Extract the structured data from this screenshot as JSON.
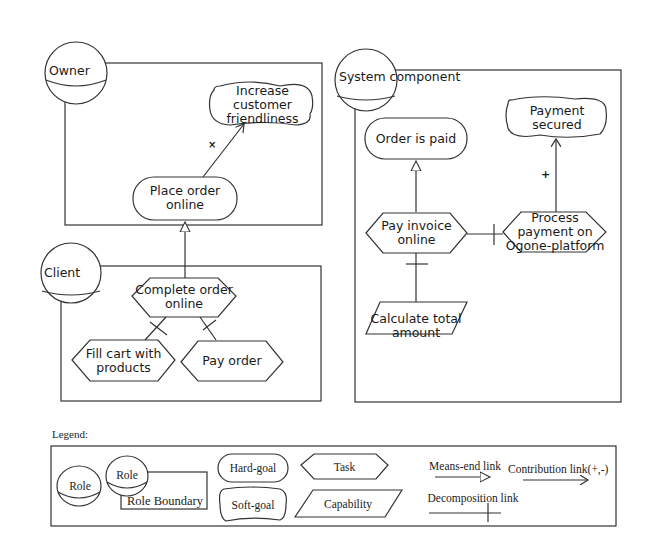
{
  "diagram": {
    "roles": [
      {
        "id": "owner",
        "label": "Owner"
      },
      {
        "id": "client",
        "label": "Client"
      },
      {
        "id": "system",
        "label": "System component"
      }
    ],
    "nodes": {
      "increase_customer_friendliness": {
        "type": "soft-goal",
        "lines": [
          "Increase",
          "customer",
          "friendliness"
        ]
      },
      "place_order_online": {
        "type": "hard-goal",
        "lines": [
          "Place order",
          "online"
        ]
      },
      "complete_order_online": {
        "type": "task",
        "lines": [
          "Complete order",
          "online"
        ]
      },
      "fill_cart": {
        "type": "task",
        "lines": [
          "Fill cart with",
          "products"
        ]
      },
      "pay_order": {
        "type": "task",
        "lines": [
          "Pay order"
        ]
      },
      "order_is_paid": {
        "type": "hard-goal",
        "lines": [
          "Order is paid"
        ]
      },
      "payment_secured": {
        "type": "soft-goal",
        "lines": [
          "Payment",
          "secured"
        ]
      },
      "pay_invoice_online": {
        "type": "task",
        "lines": [
          "Pay invoice",
          "online"
        ]
      },
      "process_payment": {
        "type": "task",
        "lines": [
          "Process",
          "payment on",
          "Ogone-platform"
        ]
      },
      "calculate_total": {
        "type": "capability",
        "lines": [
          "Calculate total",
          "amount"
        ]
      }
    },
    "links": [
      {
        "from": "place_order_online",
        "to": "increase_customer_friendliness",
        "type": "contribution",
        "sign": "×"
      },
      {
        "from": "complete_order_online",
        "to": "place_order_online",
        "type": "means-end"
      },
      {
        "from": "complete_order_online",
        "to": "fill_cart",
        "type": "decomposition"
      },
      {
        "from": "complete_order_online",
        "to": "pay_order",
        "type": "decomposition"
      },
      {
        "from": "pay_invoice_online",
        "to": "order_is_paid",
        "type": "means-end"
      },
      {
        "from": "process_payment",
        "to": "payment_secured",
        "type": "contribution",
        "sign": "+"
      },
      {
        "from": "pay_invoice_online",
        "to": "process_payment",
        "type": "decomposition"
      },
      {
        "from": "pay_invoice_online",
        "to": "calculate_total",
        "type": "decomposition"
      }
    ],
    "contribution_signs": {
      "owner": "×",
      "system": "+"
    }
  },
  "legend": {
    "title": "Legend:",
    "role": "Role",
    "role_boundary_role": "Role",
    "role_boundary": "Role Boundary",
    "hard_goal": "Hard-goal",
    "soft_goal": "Soft-goal",
    "task": "Task",
    "capability": "Capability",
    "means_end_link": "Means-end link",
    "decomposition_link": "Decomposition link",
    "contribution_link": "Contribution link(+,-)"
  },
  "colors": {
    "stroke": "#333333",
    "background": "#ffffff",
    "text": "#1a1a1a"
  }
}
